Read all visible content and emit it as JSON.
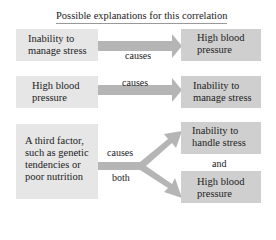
{
  "title": "Possible explanations for this correlation",
  "rows": [
    {
      "left": "Inability to manage stress",
      "relation": "causes",
      "right": "High blood pressure"
    },
    {
      "left": "High blood pressure",
      "relation": "causes",
      "right": "Inability to manage stress"
    }
  ],
  "third": {
    "left": "A third factor, such as genetic tendencies or poor nutrition",
    "relation_top": "causes",
    "relation_bottom": "both",
    "right_top": "Inability to handle stress",
    "connector": "and",
    "right_bottom": "High blood pressure"
  },
  "colors": {
    "box_light": "#e6e6e6",
    "box_dark": "#cfcfcf",
    "arrow": "#b5b5b5"
  }
}
